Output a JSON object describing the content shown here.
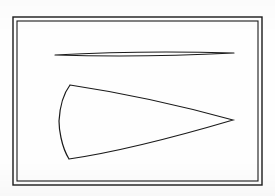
{
  "figure": {
    "title": "Two outlined planar regions inside a rectangular frame",
    "background_color": "#fefefe",
    "ink_color": "#1a1a1a",
    "frame": {
      "name": "double-rule-rectangle",
      "outer": {
        "x": 13,
        "y": 17,
        "width": 249,
        "height": 168
      },
      "inner": {
        "x": 17,
        "y": 21,
        "width": 241,
        "height": 160
      },
      "outer_stroke_width": 1.4,
      "inner_stroke_width": 1.1,
      "fill": "none"
    },
    "shapes": [
      {
        "id": "upper-lens",
        "label": "thin lens sliver",
        "description": "very slender biconvex lens, horizontal, sharp cusps at both ends",
        "left_tip": {
          "x": 55,
          "y": 55
        },
        "right_tip": {
          "x": 234,
          "y": 53
        },
        "max_thickness_px": 4,
        "max_thickness_at_x": 140,
        "stroke_width": 1.1,
        "fill": "none"
      },
      {
        "id": "lower-horn",
        "label": "cusped horn wedge",
        "description": "broad at left with two sharp corners and a convex left edge, tapering rightward to a single sharp point; both long edges bow outward",
        "corner_top_left": {
          "x": 70,
          "y": 85
        },
        "corner_bottom_left": {
          "x": 69,
          "y": 159
        },
        "left_edge_bulge": {
          "x": 59,
          "y": 121
        },
        "right_tip": {
          "x": 233,
          "y": 120
        },
        "stroke_width": 1.2,
        "fill": "none"
      }
    ]
  }
}
